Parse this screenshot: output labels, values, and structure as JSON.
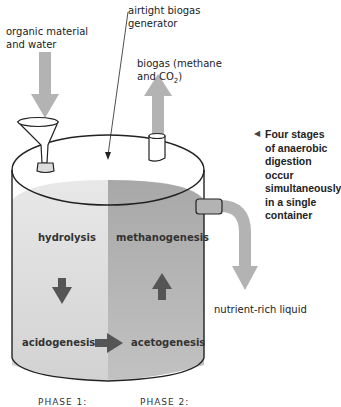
{
  "labels": {
    "input": "organic material and water",
    "generator": "airtight biogas generator",
    "biogas_line1": "biogas (methane",
    "biogas_line2_prefix": "and CO",
    "biogas_line2_sub": "2",
    "biogas_line2_suffix": ")",
    "output": "nutrient-rich liquid"
  },
  "note": {
    "marker": "◀",
    "text": "Four stages of anaerobic digestion occur simultaneously in a single container"
  },
  "stages": {
    "hydrolysis": "hydrolysis",
    "methanogenesis": "methanogenesis",
    "acidogenesis": "acidogenesis",
    "acetogenesis": "acetogenesis"
  },
  "phases": {
    "phase1": "PHASE 1:",
    "phase2": "PHASE 2:"
  },
  "colors": {
    "arrow_gray": "#b3b3b3",
    "stage_arrow": "#555555",
    "liquid_light": "#d6d6d6",
    "liquid_dark": "#a9a9a9",
    "outline": "#222222"
  }
}
